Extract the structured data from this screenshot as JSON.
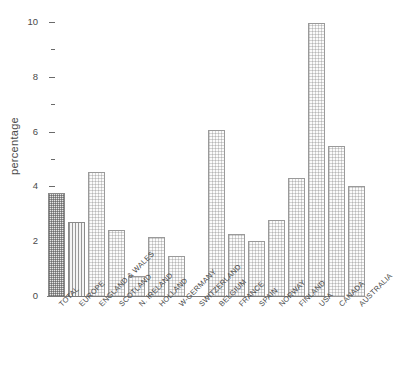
{
  "chart_data": {
    "type": "bar",
    "title": "",
    "xlabel": "",
    "ylabel": "percentage",
    "ylim": [
      0,
      10
    ],
    "grid": false,
    "legend": "none",
    "y_major_ticks": [
      "10",
      "8",
      "6",
      "4",
      "2",
      "0"
    ],
    "y_minor_ticks": [
      9,
      7,
      5,
      3,
      1
    ],
    "categories": [
      "TOTAL",
      "EUROPE",
      "ENGLAND & WALES",
      "SCOTLAND",
      "N. IRELAND",
      "HOLLAND",
      "W-GERMANY",
      "SWITZERLAND",
      "BELGIUM",
      "FRANCE",
      "SPAIN",
      "NORWAY",
      "FINLAND",
      "USA",
      "CANADA",
      "AUSTRALIA"
    ],
    "values": [
      3.8,
      2.75,
      4.55,
      2.45,
      0.78,
      2.2,
      1.5,
      null,
      6.1,
      2.3,
      2.05,
      2.8,
      4.35,
      10.0,
      5.5,
      4.05
    ],
    "bars": [
      {
        "label": "TOTAL",
        "value": 3.8,
        "fill": "dense"
      },
      {
        "label": "EUROPE",
        "value": 2.75,
        "fill": "vstripe"
      },
      {
        "label": "ENGLAND & WALES",
        "value": 4.55,
        "fill": "dotted"
      },
      {
        "label": "SCOTLAND",
        "value": 2.45,
        "fill": "dotted"
      },
      {
        "label": "N. IRELAND",
        "value": 0.78,
        "fill": "dotted"
      },
      {
        "label": "HOLLAND",
        "value": 2.2,
        "fill": "dotted"
      },
      {
        "label": "W-GERMANY",
        "value": 1.5,
        "fill": "dotted"
      },
      {
        "label": "SWITZERLAND",
        "value": null,
        "fill": "none"
      },
      {
        "label": "BELGIUM",
        "value": 6.1,
        "fill": "dotted"
      },
      {
        "label": "FRANCE",
        "value": 2.3,
        "fill": "dotted"
      },
      {
        "label": "SPAIN",
        "value": 2.05,
        "fill": "dotted"
      },
      {
        "label": "NORWAY",
        "value": 2.8,
        "fill": "dotted"
      },
      {
        "label": "FINLAND",
        "value": 4.35,
        "fill": "dotted"
      },
      {
        "label": "USA",
        "value": 10.0,
        "fill": "dotted"
      },
      {
        "label": "CANADA",
        "value": 5.5,
        "fill": "dotted"
      },
      {
        "label": "AUSTRALIA",
        "value": 4.05,
        "fill": "dotted"
      }
    ]
  },
  "colors": {
    "background": "#ffffff",
    "axis": "#7a7a7a",
    "bar_outline": "#9a9a9a",
    "bar_fill_light": "#fbfbfb",
    "bar_fill_dense": "#e6e6e6",
    "text": "#4a4a4a"
  }
}
